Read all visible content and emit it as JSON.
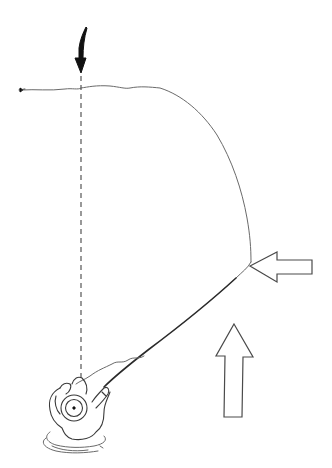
{
  "diagram": {
    "colors": {
      "background": "#ffffff",
      "ink": "#111111",
      "line": "#6a6a6a"
    },
    "elements": {
      "target_arrow": {
        "icon": "curved-down-arrow",
        "fill": "solid-black",
        "points_to": "fly landing spot"
      },
      "fly_line": {
        "shape": "curved loop from angler rod tip up and around to left"
      },
      "guide_line": {
        "style": "dashed",
        "orientation": "vertical",
        "from": "fly",
        "to": "angler"
      },
      "side_arrow": {
        "icon": "outline-left-arrow",
        "direction": "left"
      },
      "current_arrow": {
        "icon": "outline-up-arrow",
        "direction": "up"
      },
      "angler": {
        "view": "top-down",
        "wading": true
      }
    },
    "labels": []
  }
}
